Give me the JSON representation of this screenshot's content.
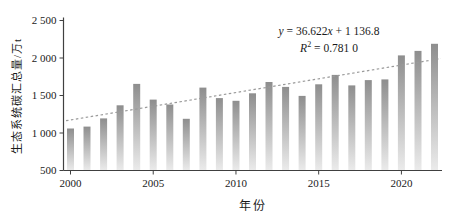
{
  "chart_data": {
    "type": "bar",
    "title": "",
    "xlabel": "年份",
    "ylabel": "生态系统碳汇总量/万t",
    "x": [
      2000,
      2001,
      2002,
      2003,
      2004,
      2005,
      2006,
      2007,
      2008,
      2009,
      2010,
      2011,
      2012,
      2013,
      2014,
      2015,
      2016,
      2017,
      2018,
      2019,
      2020,
      2021,
      2022
    ],
    "values": [
      1060,
      1085,
      1195,
      1370,
      1655,
      1445,
      1380,
      1190,
      1605,
      1465,
      1430,
      1530,
      1680,
      1615,
      1495,
      1650,
      1775,
      1635,
      1705,
      1715,
      2035,
      2095,
      2190
    ],
    "ylim": [
      500,
      2500
    ],
    "ytick_step": 500,
    "ytick_labels": [
      "500",
      "1 000",
      "1 500",
      "2 000",
      "2 500"
    ],
    "xticks": [
      2000,
      2005,
      2010,
      2015,
      2020
    ],
    "grid": false,
    "legend": "none",
    "bar_color_top": "#8e8e8e",
    "bar_color_bottom": "#ebebeb",
    "axis_color": "#404040",
    "text_color": "#1a1a1a",
    "trendline": {
      "style": "dashed",
      "color": "#9a9a9a",
      "slope": 36.622,
      "intercept": 1136.8,
      "eq_var1": "y",
      "eq_part1": " = 36.622",
      "eq_var2": "x",
      "eq_part2": " + 1 136.8",
      "r2_var": "R",
      "r2_sup": "2",
      "r2_text": " = 0.781 0"
    }
  }
}
